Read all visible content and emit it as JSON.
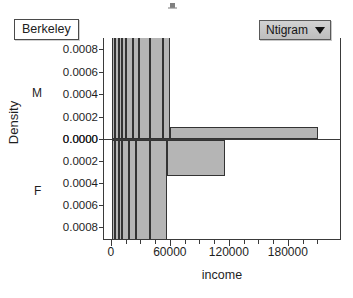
{
  "group_selector": {
    "label": "Berkeley",
    "name": "group-label"
  },
  "plot_type_dropdown": {
    "label": "Ntigram",
    "caret": "chevron-down-icon"
  },
  "chart_data": {
    "type": "bar",
    "title": "",
    "subtitle": "",
    "xlabel": "income",
    "ylabel": "Density",
    "xlim": [
      -8000,
      232000
    ],
    "ylim_male": [
      0.0,
      0.0009
    ],
    "ylim_female": [
      0.0,
      0.0009
    ],
    "grid": false,
    "legend_position": "none",
    "panels": [
      {
        "tag": "M",
        "direction": "up",
        "ytick_labels": [
          "0.0008",
          "0.0006",
          "0.0004",
          "0.0002",
          "0.0000"
        ],
        "ytick_values": [
          0.0008,
          0.0006,
          0.0004,
          0.0002,
          0.0
        ],
        "bins": [
          {
            "x0": 0,
            "x1": 3500,
            "density": 0.00092
          },
          {
            "x0": 3500,
            "x1": 7000,
            "density": 0.00092
          },
          {
            "x0": 7000,
            "x1": 10500,
            "density": 0.00092
          },
          {
            "x0": 10500,
            "x1": 14000,
            "density": 0.00092
          },
          {
            "x0": 14000,
            "x1": 21000,
            "density": 0.00092
          },
          {
            "x0": 21000,
            "x1": 28000,
            "density": 0.00092
          },
          {
            "x0": 28000,
            "x1": 38500,
            "density": 0.00092
          },
          {
            "x0": 38500,
            "x1": 52500,
            "density": 0.00092
          },
          {
            "x0": 52500,
            "x1": 59000,
            "density": 0.00092
          },
          {
            "x0": 59000,
            "x1": 210000,
            "density": 0.00011
          }
        ]
      },
      {
        "tag": "F",
        "direction": "down",
        "ytick_labels": [
          "0.0000",
          "0.0008",
          "0.0006",
          "0.0004",
          "0.0002"
        ],
        "ytick_values": [
          0.0,
          0.0008,
          0.0006,
          0.0004,
          0.0002
        ],
        "bins": [
          {
            "x0": 0,
            "x1": 3500,
            "density": 0.00092
          },
          {
            "x0": 3500,
            "x1": 7000,
            "density": 0.00092
          },
          {
            "x0": 7000,
            "x1": 10500,
            "density": 0.00092
          },
          {
            "x0": 10500,
            "x1": 17500,
            "density": 0.00092
          },
          {
            "x0": 17500,
            "x1": 24500,
            "density": 0.00092
          },
          {
            "x0": 24500,
            "x1": 38500,
            "density": 0.00092
          },
          {
            "x0": 38500,
            "x1": 56000,
            "density": 0.00092
          },
          {
            "x0": 56000,
            "x1": 115000,
            "density": 0.00033
          }
        ]
      }
    ],
    "xtick_labels": [
      "0",
      "60000",
      "120000",
      "180000"
    ],
    "xtick_values": [
      0,
      60000,
      120000,
      180000
    ],
    "xtick_minor_values": [
      15000,
      30000,
      45000,
      75000,
      90000,
      105000,
      135000,
      150000,
      165000,
      195000,
      210000
    ],
    "colors": {
      "bar_fill": "#b5b5b5",
      "bar_border": "#333333",
      "axis": "#3a3a3a",
      "background": "#ffffff",
      "dropdown_fill": "#c9c9c9"
    }
  }
}
